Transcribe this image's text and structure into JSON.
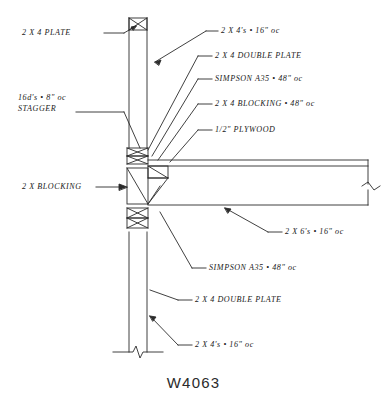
{
  "drawing": {
    "title": "W4063",
    "labels": {
      "top_plate": "2 X 4  PLATE",
      "nailing_line1": "16d's  •  8\"  oc",
      "nailing_line2": "STAGGER",
      "blocking_left": "2 X  BLOCKING",
      "studs_top": "2 X 4's • 16\" oc",
      "double_plate_top": "2 X 4  DOUBLE  PLATE",
      "simpson_top": "SIMPSON  A35 • 48\" oc",
      "blocking_top": "2 X 4  BLOCKING • 48\" oc",
      "plywood": "1/2\"  PLYWOOD",
      "joists": "2 X 6's • 16\" oc",
      "simpson_bottom": "SIMPSON  A35 • 48\" oc",
      "double_plate_bottom": "2 X 4  DOUBLE  PLATE",
      "studs_bottom": "2 X 4's • 16\" oc"
    },
    "colors": {
      "line": "#2b2b2b",
      "text": "#1a1a1a",
      "background": "#ffffff"
    }
  }
}
